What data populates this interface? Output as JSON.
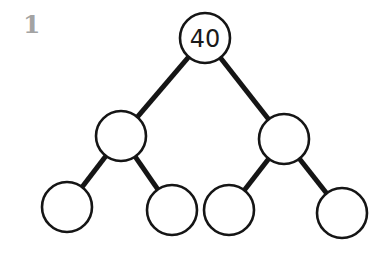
{
  "problem_number": "1",
  "tree": {
    "nodes": [
      {
        "id": "root",
        "label": "40",
        "cx": 205,
        "cy": 38,
        "r": 25
      },
      {
        "id": "left",
        "label": "",
        "cx": 121,
        "cy": 136,
        "r": 25
      },
      {
        "id": "right",
        "label": "",
        "cx": 284,
        "cy": 139,
        "r": 25
      },
      {
        "id": "left-left",
        "label": "",
        "cx": 67,
        "cy": 207,
        "r": 25
      },
      {
        "id": "left-right",
        "label": "",
        "cx": 172,
        "cy": 210,
        "r": 25
      },
      {
        "id": "right-left",
        "label": "",
        "cx": 229,
        "cy": 210,
        "r": 25
      },
      {
        "id": "right-right",
        "label": "",
        "cx": 342,
        "cy": 213,
        "r": 25
      }
    ],
    "edges": [
      {
        "from": "root",
        "to": "left"
      },
      {
        "from": "root",
        "to": "right"
      },
      {
        "from": "left",
        "to": "left-left"
      },
      {
        "from": "left",
        "to": "left-right"
      },
      {
        "from": "right",
        "to": "right-left"
      },
      {
        "from": "right",
        "to": "right-right"
      }
    ]
  }
}
